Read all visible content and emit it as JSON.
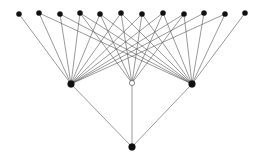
{
  "figure": {
    "width": 260,
    "height": 161,
    "background_color": "#ffffff",
    "edge_color": "#555555",
    "edge_width": 0.6,
    "node_fill_color": "#111111",
    "node_stroke_color": "#111111",
    "hollow_node_fill_color": "#ffffff"
  },
  "graph_data": {
    "type": "node-link-diagram",
    "layers": [
      {
        "name": "top-layer",
        "count": 12,
        "node_radius": 2.6,
        "style": "filled"
      },
      {
        "name": "middle-layer",
        "count": 3,
        "node_radius": 3.2,
        "style": "mixed"
      },
      {
        "name": "bottom-layer",
        "count": 1,
        "node_radius": 3.2,
        "style": "filled"
      }
    ],
    "nodes": [
      {
        "id": "t1",
        "layer": "top",
        "x": 19,
        "y": 14,
        "r": 2.6,
        "filled": true
      },
      {
        "id": "t2",
        "layer": "top",
        "x": 39,
        "y": 13,
        "r": 2.6,
        "filled": true
      },
      {
        "id": "t3",
        "layer": "top",
        "x": 60,
        "y": 14,
        "r": 2.6,
        "filled": true
      },
      {
        "id": "t4",
        "layer": "top",
        "x": 80,
        "y": 13,
        "r": 2.6,
        "filled": true
      },
      {
        "id": "t5",
        "layer": "top",
        "x": 100,
        "y": 14,
        "r": 2.6,
        "filled": true
      },
      {
        "id": "t6",
        "layer": "top",
        "x": 121,
        "y": 13,
        "r": 2.6,
        "filled": true
      },
      {
        "id": "t7",
        "layer": "top",
        "x": 142,
        "y": 14,
        "r": 2.6,
        "filled": true
      },
      {
        "id": "t8",
        "layer": "top",
        "x": 163,
        "y": 13,
        "r": 2.6,
        "filled": true
      },
      {
        "id": "t9",
        "layer": "top",
        "x": 184,
        "y": 14,
        "r": 2.6,
        "filled": true
      },
      {
        "id": "t10",
        "layer": "top",
        "x": 204,
        "y": 13,
        "r": 2.6,
        "filled": true
      },
      {
        "id": "t11",
        "layer": "top",
        "x": 225,
        "y": 14,
        "r": 2.6,
        "filled": true
      },
      {
        "id": "t12",
        "layer": "top",
        "x": 245,
        "y": 13,
        "r": 2.6,
        "filled": true
      },
      {
        "id": "m1",
        "layer": "middle",
        "x": 71,
        "y": 84,
        "r": 3.4,
        "filled": true
      },
      {
        "id": "m2",
        "layer": "middle",
        "x": 132,
        "y": 83,
        "r": 2.6,
        "filled": false
      },
      {
        "id": "m3",
        "layer": "middle",
        "x": 192,
        "y": 84,
        "r": 3.4,
        "filled": true
      },
      {
        "id": "b1",
        "layer": "bottom",
        "x": 132,
        "y": 147,
        "r": 3.4,
        "filled": true
      }
    ],
    "edges": [
      {
        "source": "m1",
        "target": "t1"
      },
      {
        "source": "m1",
        "target": "t2"
      },
      {
        "source": "m1",
        "target": "t3"
      },
      {
        "source": "m1",
        "target": "t4"
      },
      {
        "source": "m1",
        "target": "t5"
      },
      {
        "source": "m1",
        "target": "t6"
      },
      {
        "source": "m1",
        "target": "t7"
      },
      {
        "source": "m1",
        "target": "t8"
      },
      {
        "source": "m1",
        "target": "t9"
      },
      {
        "source": "m1",
        "target": "t10"
      },
      {
        "source": "m1",
        "target": "t11"
      },
      {
        "source": "m2",
        "target": "t4"
      },
      {
        "source": "m2",
        "target": "t5"
      },
      {
        "source": "m2",
        "target": "t6"
      },
      {
        "source": "m2",
        "target": "t7"
      },
      {
        "source": "m2",
        "target": "t8"
      },
      {
        "source": "m2",
        "target": "t9"
      },
      {
        "source": "m3",
        "target": "t2"
      },
      {
        "source": "m3",
        "target": "t3"
      },
      {
        "source": "m3",
        "target": "t4"
      },
      {
        "source": "m3",
        "target": "t5"
      },
      {
        "source": "m3",
        "target": "t6"
      },
      {
        "source": "m3",
        "target": "t7"
      },
      {
        "source": "m3",
        "target": "t8"
      },
      {
        "source": "m3",
        "target": "t9"
      },
      {
        "source": "m3",
        "target": "t10"
      },
      {
        "source": "m3",
        "target": "t11"
      },
      {
        "source": "m3",
        "target": "t12"
      },
      {
        "source": "b1",
        "target": "m1"
      },
      {
        "source": "b1",
        "target": "m2"
      },
      {
        "source": "b1",
        "target": "m3"
      }
    ]
  }
}
